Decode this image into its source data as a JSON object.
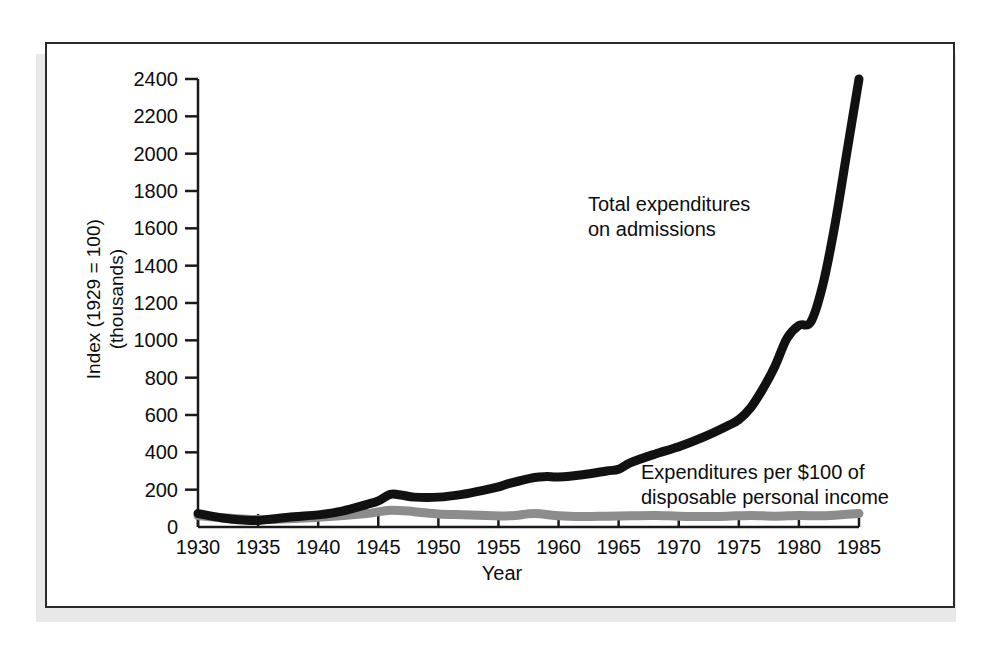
{
  "chart_data": {
    "type": "line",
    "title": "",
    "xlabel": "Year",
    "ylabel": "Index (1929 = 100) (thousands)",
    "ylabel_line1": "Index (1929 = 100)",
    "ylabel_line2": "(thousands)",
    "xlim": [
      1930,
      1985
    ],
    "ylim": [
      0,
      2400
    ],
    "xticks": [
      1930,
      1935,
      1940,
      1945,
      1950,
      1955,
      1960,
      1965,
      1970,
      1975,
      1980,
      1985
    ],
    "xtick_labels": [
      "1930",
      "1935",
      "1940",
      "1945",
      "1950",
      "1955",
      "1960",
      "1965",
      "1970",
      "1975",
      "1980",
      "1985"
    ],
    "yticks": [
      0,
      200,
      400,
      600,
      800,
      1000,
      1200,
      1400,
      1600,
      1800,
      2000,
      2200,
      2400
    ],
    "ytick_labels": [
      "0",
      "200",
      "400",
      "600",
      "800",
      "1000",
      "1200",
      "1400",
      "1600",
      "1800",
      "2000",
      "2200",
      "2400"
    ],
    "grid": false,
    "legend_position": "inline-annotations",
    "series": [
      {
        "name": "Total expenditures on admissions",
        "label_line1": "Total expenditures",
        "label_line2": "on admissions",
        "color": "#111111",
        "line_width": 9,
        "x": [
          1930,
          1932,
          1934,
          1935,
          1936,
          1938,
          1940,
          1942,
          1944,
          1945,
          1946,
          1947,
          1948,
          1950,
          1952,
          1954,
          1955,
          1956,
          1958,
          1959,
          1960,
          1962,
          1964,
          1965,
          1966,
          1968,
          1970,
          1972,
          1974,
          1975,
          1976,
          1977,
          1978,
          1979,
          1980,
          1981,
          1982,
          1983,
          1984,
          1985
        ],
        "y": [
          72,
          48,
          36,
          35,
          42,
          55,
          65,
          85,
          120,
          140,
          175,
          170,
          160,
          160,
          175,
          200,
          215,
          235,
          265,
          270,
          268,
          280,
          300,
          310,
          345,
          390,
          430,
          480,
          540,
          575,
          640,
          740,
          860,
          1010,
          1080,
          1100,
          1300,
          1620,
          2010,
          2400
        ]
      },
      {
        "name": "Expenditures per $100 of disposable personal income",
        "label_line1": "Expenditures per $100 of",
        "label_line2": "disposable personal income",
        "color": "#8c8c8c",
        "line_width": 9,
        "x": [
          1930,
          1935,
          1940,
          1944,
          1946,
          1948,
          1950,
          1952,
          1954,
          1956,
          1958,
          1960,
          1962,
          1964,
          1966,
          1968,
          1970,
          1972,
          1974,
          1976,
          1978,
          1980,
          1982,
          1984,
          1985
        ],
        "y": [
          60,
          40,
          52,
          72,
          90,
          82,
          70,
          66,
          62,
          60,
          72,
          60,
          56,
          58,
          60,
          62,
          58,
          56,
          58,
          62,
          58,
          62,
          60,
          68,
          72
        ]
      }
    ]
  },
  "axes": {
    "x_title": "Year",
    "y_title_line1": "Index (1929 = 100)",
    "y_title_line2": "(thousands)"
  }
}
